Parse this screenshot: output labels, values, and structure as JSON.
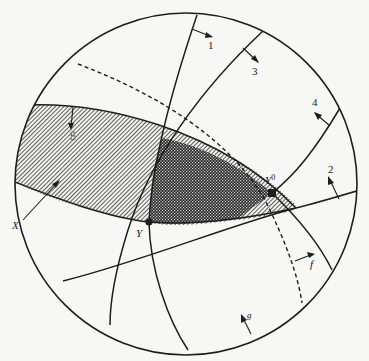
{
  "figure": {
    "colors": {
      "background": "#f7f7f5",
      "ink": "#1e1e1e",
      "hatch_light": "#4a4a4a",
      "hatch_dark": "#2a2a2a"
    }
  },
  "labels": {
    "line_1": "1",
    "line_2": "2",
    "line_3": "3",
    "line_4": "4",
    "line_5": "5",
    "line_f": "f",
    "line_g": "g",
    "point_x": "X",
    "point_y": "Y",
    "point_y0": "Y",
    "point_y0_sup": "0"
  }
}
